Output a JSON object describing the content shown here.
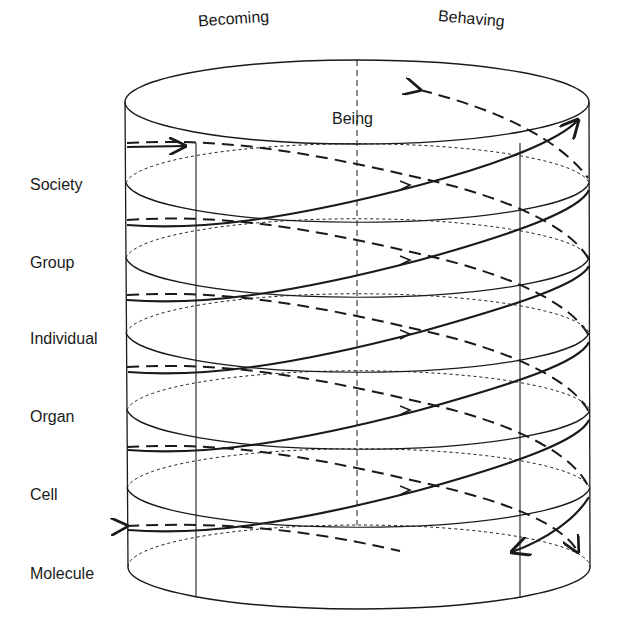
{
  "diagram": {
    "axes": {
      "becoming": "Becoming",
      "being": "Being",
      "behaving": "Behaving"
    },
    "levels": [
      "Society",
      "Group",
      "Individual",
      "Organ",
      "Cell",
      "Molecule"
    ],
    "colors": {
      "line": "#1a1a1a",
      "background": "#ffffff"
    }
  }
}
